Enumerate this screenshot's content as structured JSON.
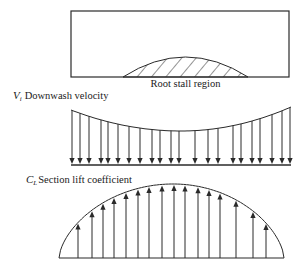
{
  "diagram": {
    "type": "wing-spanwise-distributions",
    "colors": {
      "stroke": "#2a2a2a",
      "text": "#1a1a1a",
      "background": "#ffffff"
    },
    "planform": {
      "rect": {
        "x": 71,
        "y": 11,
        "w": 218,
        "h": 66
      },
      "stall_region": {
        "x0": 123,
        "x1": 248,
        "base_y": 77,
        "peak_y": 57
      },
      "label": "Root stall region"
    },
    "downwash": {
      "symbol": "V",
      "subscript": "i",
      "label": "Downwash velocity",
      "baseline_y": 164,
      "x0": 71,
      "x1": 291,
      "curve": {
        "left_y": 110,
        "min_y": 131,
        "right_y": 107
      },
      "arrow_x": [
        72,
        80,
        89,
        101,
        108,
        118,
        129,
        140,
        152,
        160,
        171,
        179,
        195,
        208,
        218,
        233,
        241,
        252,
        260,
        272,
        282,
        290
      ]
    },
    "lift": {
      "symbol": "C",
      "subscript": "L",
      "label": "Section lift coefficient",
      "baseline_y": 258,
      "x0": 59,
      "x1": 284,
      "peak": {
        "x": 173,
        "y": 184
      },
      "arrow_x": [
        78,
        92,
        103,
        114,
        126,
        138,
        149,
        162,
        174,
        185,
        198,
        209,
        220,
        236,
        253,
        266
      ]
    }
  }
}
